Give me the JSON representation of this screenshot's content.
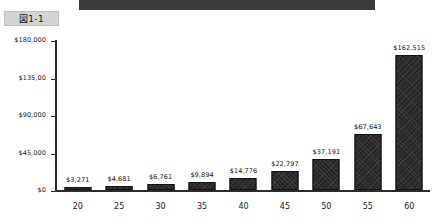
{
  "figure": {
    "badge_label": "図1-1"
  },
  "banner": {
    "present": true,
    "color": "#3b3b3b"
  },
  "chart_data": {
    "type": "bar",
    "title": "",
    "subtitle": "",
    "xlabel": "",
    "ylabel": "",
    "categories": [
      "20",
      "25",
      "30",
      "35",
      "40",
      "45",
      "50",
      "55",
      "60"
    ],
    "values": [
      3271,
      4681,
      6761,
      9894,
      14776,
      22797,
      37191,
      67643,
      162515
    ],
    "data_labels": [
      "$3,271",
      "$4,681",
      "$6,761",
      "$9,894",
      "$14,776",
      "$22,797",
      "$37,191",
      "$67,643",
      "$162,515"
    ],
    "ylim": [
      0,
      180000
    ],
    "yticks": [
      0,
      45000,
      90000,
      135000,
      180000
    ],
    "ytick_labels": [
      "$0",
      "$45,000",
      "$90,000",
      "$135,00",
      "$180,000"
    ],
    "grid": false,
    "legend": null,
    "bar_color": "#242424"
  }
}
